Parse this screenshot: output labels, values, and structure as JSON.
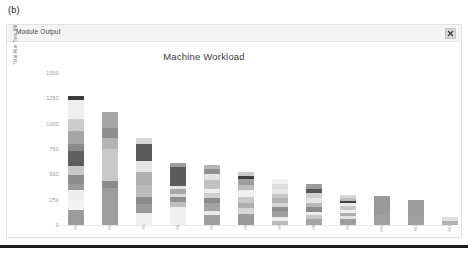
{
  "figure": {
    "label": "(b)"
  },
  "window": {
    "title": "Module Output",
    "close_icon": "close-icon",
    "close_label": "×"
  },
  "chart_data": {
    "type": "bar",
    "subtype": "stacked-bar",
    "title": "Machine Workload",
    "xlabel": "",
    "ylabel": "Total Run Time (Minutes)",
    "ylim": [
      0,
      1500
    ],
    "yticks": [
      0,
      250,
      500,
      750,
      1000,
      1250,
      1500
    ],
    "ytick_labels": [
      "0",
      "250",
      "500",
      "750",
      "1000",
      "1250",
      "1500"
    ],
    "grid": false,
    "legend": "none",
    "palette": [
      "#8e8e8e",
      "#e9e9e9",
      "#a8a8a8",
      "#7c7c7c",
      "#c9c9c9",
      "#555555",
      "#b6b6b6",
      "#9a9a9a",
      "#d8d8d8",
      "#6b6b6b",
      "#efefef",
      "#3a3a3a"
    ],
    "categories": [
      "M1",
      "M2",
      "M3",
      "M4",
      "M5",
      "M6",
      "M7",
      "M8",
      "M9",
      "M10",
      "M11",
      "M12"
    ],
    "totals": [
      1270,
      1115,
      1060,
      705,
      590,
      525,
      455,
      410,
      300,
      290,
      245,
      75
    ],
    "bars": [
      {
        "category": "M1",
        "total": 1270,
        "segments": [
          {
            "value": 150,
            "color": "#9c9c9c"
          },
          {
            "value": 95,
            "color": "#f2f2f2"
          },
          {
            "value": 100,
            "color": "#ededed"
          },
          {
            "value": 60,
            "color": "#9a9a9a"
          },
          {
            "value": 85,
            "color": "#8d8d8d"
          },
          {
            "value": 95,
            "color": "#c8c8c8"
          },
          {
            "value": 150,
            "color": "#5e5e5e"
          },
          {
            "value": 60,
            "color": "#8a8a8a"
          },
          {
            "value": 135,
            "color": "#a6a6a6"
          },
          {
            "value": 120,
            "color": "#cdcdcd"
          },
          {
            "value": 180,
            "color": "#efefef"
          },
          {
            "value": 40,
            "color": "#3c3c3c"
          }
        ]
      },
      {
        "category": "M2",
        "total": 1115,
        "segments": [
          {
            "value": 370,
            "color": "#9d9d9d"
          },
          {
            "value": 60,
            "color": "#8a8a8a"
          },
          {
            "value": 320,
            "color": "#c9c9c9"
          },
          {
            "value": 105,
            "color": "#b3b3b3"
          },
          {
            "value": 100,
            "color": "#8e8e8e"
          },
          {
            "value": 160,
            "color": "#a5a5a5"
          }
        ]
      },
      {
        "category": "M3",
        "total": 1060,
        "segments": [
          {
            "value": 120,
            "color": "#efefef"
          },
          {
            "value": 90,
            "color": "#9a9a9a"
          },
          {
            "value": 70,
            "color": "#8c8c8c"
          },
          {
            "value": 115,
            "color": "#bcbcbc"
          },
          {
            "value": 130,
            "color": "#b0b0b0"
          },
          {
            "value": 105,
            "color": "#e6e6e6"
          },
          {
            "value": 175,
            "color": "#5a5a5a"
          },
          {
            "value": 55,
            "color": "#d5d5d5"
          }
        ]
      },
      {
        "category": "M4",
        "total": 705,
        "segments": [
          {
            "value": 180,
            "color": "#f0f0f0"
          },
          {
            "value": 50,
            "color": "#bfbfbf"
          },
          {
            "value": 45,
            "color": "#8f8f8f"
          },
          {
            "value": 35,
            "color": "#d9d9d9"
          },
          {
            "value": 45,
            "color": "#a8a8a8"
          },
          {
            "value": 35,
            "color": "#e4e4e4"
          },
          {
            "value": 185,
            "color": "#5c5c5c"
          },
          {
            "value": 35,
            "color": "#9d9d9d"
          }
        ]
      },
      {
        "category": "M5",
        "total": 590,
        "segments": [
          {
            "value": 95,
            "color": "#9e9e9e"
          },
          {
            "value": 45,
            "color": "#e8e8e8"
          },
          {
            "value": 75,
            "color": "#a3a3a3"
          },
          {
            "value": 55,
            "color": "#8c8c8c"
          },
          {
            "value": 45,
            "color": "#cfcfcf"
          },
          {
            "value": 45,
            "color": "#efefef"
          },
          {
            "value": 85,
            "color": "#c0c0c0"
          },
          {
            "value": 55,
            "color": "#e2e2e2"
          },
          {
            "value": 55,
            "color": "#8f8f8f"
          },
          {
            "value": 35,
            "color": "#b5b5b5"
          }
        ]
      },
      {
        "category": "M6",
        "total": 525,
        "segments": [
          {
            "value": 105,
            "color": "#9a9a9a"
          },
          {
            "value": 60,
            "color": "#d6d6d6"
          },
          {
            "value": 55,
            "color": "#aeaeae"
          },
          {
            "value": 55,
            "color": "#c8c8c8"
          },
          {
            "value": 75,
            "color": "#efefef"
          },
          {
            "value": 45,
            "color": "#bdbdbd"
          },
          {
            "value": 55,
            "color": "#9f9f9f"
          },
          {
            "value": 35,
            "color": "#3f3f3f"
          },
          {
            "value": 40,
            "color": "#cacaca"
          }
        ]
      },
      {
        "category": "M7",
        "total": 455,
        "segments": [
          {
            "value": 40,
            "color": "#bbbbbb"
          },
          {
            "value": 35,
            "color": "#ededed"
          },
          {
            "value": 60,
            "color": "#a0a0a0"
          },
          {
            "value": 45,
            "color": "#8e8e8e"
          },
          {
            "value": 35,
            "color": "#d5d5d5"
          },
          {
            "value": 50,
            "color": "#b3b3b3"
          },
          {
            "value": 45,
            "color": "#c5c5c5"
          },
          {
            "value": 45,
            "color": "#e6e6e6"
          },
          {
            "value": 55,
            "color": "#dcdcdc"
          },
          {
            "value": 45,
            "color": "#f1f1f1"
          }
        ]
      },
      {
        "category": "M8",
        "total": 410,
        "segments": [
          {
            "value": 55,
            "color": "#a4a4a4"
          },
          {
            "value": 40,
            "color": "#c7c7c7"
          },
          {
            "value": 35,
            "color": "#ededed"
          },
          {
            "value": 45,
            "color": "#8d8d8d"
          },
          {
            "value": 45,
            "color": "#b8b8b8"
          },
          {
            "value": 50,
            "color": "#e6e6e6"
          },
          {
            "value": 45,
            "color": "#d0d0d0"
          },
          {
            "value": 45,
            "color": "#555555"
          },
          {
            "value": 50,
            "color": "#9b9b9b"
          }
        ]
      },
      {
        "category": "M9",
        "total": 300,
        "segments": [
          {
            "value": 55,
            "color": "#9e9e9e"
          },
          {
            "value": 30,
            "color": "#e4e4e4"
          },
          {
            "value": 35,
            "color": "#aeaeae"
          },
          {
            "value": 30,
            "color": "#f0f0f0"
          },
          {
            "value": 35,
            "color": "#c6c6c6"
          },
          {
            "value": 30,
            "color": "#e9e9e9"
          },
          {
            "value": 25,
            "color": "#404040"
          },
          {
            "value": 30,
            "color": "#bdbdbd"
          },
          {
            "value": 30,
            "color": "#d8d8d8"
          }
        ]
      },
      {
        "category": "M10",
        "total": 290,
        "segments": [
          {
            "value": 95,
            "color": "#a0a0a0"
          },
          {
            "value": 195,
            "color": "#9a9a9a"
          }
        ]
      },
      {
        "category": "M11",
        "total": 245,
        "segments": [
          {
            "value": 85,
            "color": "#a2a2a2"
          },
          {
            "value": 160,
            "color": "#9c9c9c"
          }
        ]
      },
      {
        "category": "M12",
        "total": 75,
        "segments": [
          {
            "value": 35,
            "color": "#b2b2b2"
          },
          {
            "value": 40,
            "color": "#e0e0e0"
          }
        ]
      }
    ]
  }
}
